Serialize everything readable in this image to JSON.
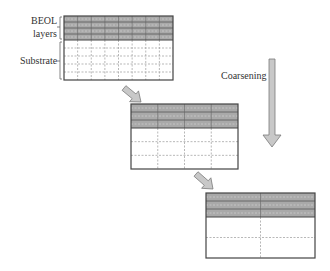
{
  "labels": {
    "beol_line1": "BEOL",
    "beol_line2": "layers",
    "substrate": "Substrate",
    "coarsening": "Coarsening"
  },
  "grids": [
    {
      "name": "fine-mesh",
      "x": 64,
      "y": 16,
      "w": 109,
      "h": 64,
      "beol_h": 24,
      "beol_rows": 4,
      "cols": 8,
      "sub_rows": 5
    },
    {
      "name": "medium-mesh",
      "x": 131,
      "y": 104,
      "w": 107,
      "h": 65,
      "beol_h": 24,
      "beol_rows": 3,
      "cols": 4,
      "sub_rows": 3
    },
    {
      "name": "coarse-mesh",
      "x": 206,
      "y": 193,
      "w": 109,
      "h": 65,
      "beol_h": 24,
      "beol_rows": 3,
      "cols": 2,
      "sub_rows": 2
    }
  ],
  "colors": {
    "beol_fill": "#a9a9a9",
    "border": "#444444",
    "dash": "#9a9a9a",
    "arrow_fill": "#c8c8c8",
    "arrow_stroke": "#7a7a7a"
  }
}
